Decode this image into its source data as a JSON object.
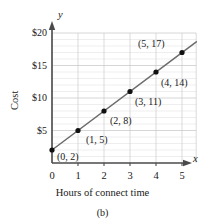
{
  "chart_data": {
    "type": "line",
    "title": "",
    "subtitle": "",
    "caption": "(b)",
    "xlabel": "Hours of connect time",
    "ylabel": "Cost",
    "x_axis_symbol": "x",
    "y_axis_symbol": "y",
    "x": [
      0,
      1,
      2,
      3,
      4,
      5
    ],
    "values": [
      2,
      5,
      8,
      11,
      14,
      17
    ],
    "xlim": [
      0,
      5.7
    ],
    "ylim": [
      0,
      20
    ],
    "xticks": [
      0,
      1,
      2,
      3,
      4,
      5
    ],
    "xtick_labels": [
      "0",
      "1",
      "2",
      "3",
      "4",
      "5"
    ],
    "yticks": [
      5,
      10,
      15,
      20
    ],
    "ytick_labels": [
      "$5",
      "$10",
      "$15",
      "$20"
    ],
    "grid": true,
    "grid_horizontal_step": 1,
    "grid_vertical_step": 1,
    "legend": "none",
    "point_labels": [
      "(0, 2)",
      "(1, 5)",
      "(2, 8)",
      "(3, 11)",
      "(4, 14)",
      "(5, 17)"
    ],
    "series_name": "Cost vs hours",
    "line_color": "#6b6b6b",
    "point_color": "#101010",
    "grid_color": "#c9c9c9",
    "axis_color": "#4a4a4a"
  }
}
